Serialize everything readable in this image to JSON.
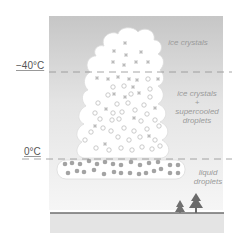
{
  "temperature_levels": [
    {
      "label": "−40°C",
      "y": 72
    },
    {
      "label": "0°C",
      "y": 159
    }
  ],
  "zones": {
    "top": {
      "label": "ice crystals"
    },
    "middle": {
      "line1": "ice crystals",
      "line2": "+",
      "line3": "supercooled",
      "line4": "droplets"
    },
    "bottom": {
      "line1": "liquid",
      "line2": "droplets"
    }
  },
  "colors": {
    "sky_top": "#c9c9c9",
    "sky_bottom": "#f4f4f4",
    "cloud": "#ffffff",
    "cloud_outline": "#d8d8d8",
    "ice_symbol": "#b8b8b8",
    "droplet_outline": "#bdbdbd",
    "liquid_droplet": "#9e9e9e",
    "ground_line": "#777777",
    "ground_fill": "#e6e6e6",
    "tree": "#6e6e6e",
    "dashed_line": "#8a8a8a",
    "label_text": "#9a9a9a"
  }
}
